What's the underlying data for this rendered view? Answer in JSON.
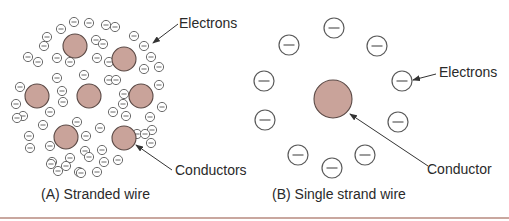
{
  "figure": {
    "panel_a": {
      "caption": "(A) Stranded wire",
      "label_electrons": "Electrons",
      "label_conductors": "Conductors",
      "conductors": [
        [
          75,
          46
        ],
        [
          124,
          59
        ],
        [
          37,
          96
        ],
        [
          89,
          96
        ],
        [
          141,
          96
        ],
        [
          66,
          137
        ],
        [
          124,
          138
        ]
      ],
      "electrons": [
        [
          74,
          22
        ],
        [
          89,
          23
        ],
        [
          106,
          25
        ],
        [
          115,
          27
        ],
        [
          61,
          29
        ],
        [
          134,
          36
        ],
        [
          47,
          37
        ],
        [
          44,
          46
        ],
        [
          96,
          40
        ],
        [
          103,
          44
        ],
        [
          144,
          46
        ],
        [
          28,
          57
        ],
        [
          38,
          62
        ],
        [
          57,
          58
        ],
        [
          70,
          62
        ],
        [
          97,
          58
        ],
        [
          151,
          57
        ],
        [
          109,
          62
        ],
        [
          144,
          69
        ],
        [
          159,
          67
        ],
        [
          57,
          78
        ],
        [
          84,
          75
        ],
        [
          109,
          80
        ],
        [
          116,
          80
        ],
        [
          20,
          87
        ],
        [
          62,
          91
        ],
        [
          159,
          85
        ],
        [
          124,
          94
        ],
        [
          16,
          104
        ],
        [
          63,
          102
        ],
        [
          123,
          104
        ],
        [
          162,
          107
        ],
        [
          23,
          116
        ],
        [
          50,
          112
        ],
        [
          113,
          112
        ],
        [
          126,
          116
        ],
        [
          150,
          117
        ],
        [
          77,
          122
        ],
        [
          17,
          118
        ],
        [
          43,
          125
        ],
        [
          100,
          128
        ],
        [
          152,
          130
        ],
        [
          137,
          134
        ],
        [
          145,
          134
        ],
        [
          29,
          136
        ],
        [
          86,
          136
        ],
        [
          30,
          148
        ],
        [
          50,
          146
        ],
        [
          151,
          143
        ],
        [
          85,
          151
        ],
        [
          102,
          150
        ],
        [
          118,
          160
        ],
        [
          104,
          162
        ],
        [
          52,
          162
        ],
        [
          70,
          158
        ],
        [
          89,
          157
        ],
        [
          58,
          171
        ],
        [
          79,
          172
        ],
        [
          97,
          172
        ],
        [
          51,
          164
        ],
        [
          66,
          166
        ],
        [
          81,
          173
        ]
      ],
      "colors": {
        "conductor_fill": "#c9a39a",
        "conductor_stroke": "#5b4a46",
        "electron_stroke": "#5a5a5a"
      }
    },
    "panel_b": {
      "caption": "(B) Single strand wire",
      "label_electrons": "Electrons",
      "label_conductor": "Conductor",
      "conductor": [
        333,
        99
      ],
      "electrons": [
        [
          334,
          28
        ],
        [
          289,
          45
        ],
        [
          377,
          46
        ],
        [
          264,
          81
        ],
        [
          402,
          81
        ],
        [
          265,
          120
        ],
        [
          398,
          122
        ],
        [
          298,
          155
        ],
        [
          365,
          155
        ],
        [
          332,
          168
        ]
      ],
      "colors": {
        "conductor_fill": "#c9a39a",
        "conductor_stroke": "#5b4a46",
        "electron_stroke": "#5a5a5a"
      }
    },
    "rule_color": "#c9a79f"
  }
}
